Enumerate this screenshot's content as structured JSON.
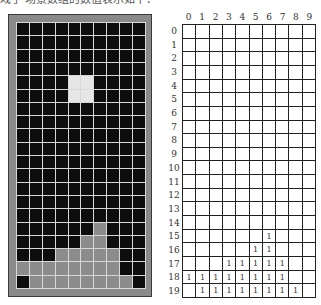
{
  "caption": "戏子 场景数组的数值表示如下：",
  "board": {
    "rows": 20,
    "cols": 10,
    "active_piece": {
      "shape": "O",
      "cells": [
        [
          4,
          4
        ],
        [
          4,
          5
        ],
        [
          5,
          4
        ],
        [
          5,
          5
        ]
      ]
    },
    "filled_cells": [
      [
        15,
        6
      ],
      [
        16,
        5
      ],
      [
        16,
        6
      ],
      [
        17,
        3
      ],
      [
        17,
        4
      ],
      [
        17,
        5
      ],
      [
        17,
        6
      ],
      [
        17,
        7
      ],
      [
        18,
        0
      ],
      [
        18,
        1
      ],
      [
        18,
        2
      ],
      [
        18,
        3
      ],
      [
        18,
        4
      ],
      [
        18,
        5
      ],
      [
        18,
        6
      ],
      [
        18,
        7
      ],
      [
        19,
        1
      ],
      [
        19,
        2
      ],
      [
        19,
        3
      ],
      [
        19,
        4
      ],
      [
        19,
        5
      ],
      [
        19,
        6
      ],
      [
        19,
        7
      ],
      [
        19,
        8
      ]
    ],
    "colors": {
      "empty": "#0d0d0d",
      "filled": "#8c8c8c",
      "active": "#e6e6e6",
      "frame": "#8a8a8a",
      "grid_line": "#d8d8d8"
    }
  },
  "table": {
    "col_headers": [
      "0",
      "1",
      "2",
      "3",
      "4",
      "5",
      "6",
      "7",
      "8",
      "9"
    ],
    "row_headers": [
      "0",
      "1",
      "2",
      "3",
      "4",
      "5",
      "6",
      "7",
      "8",
      "9",
      "10",
      "11",
      "12",
      "13",
      "14",
      "15",
      "16",
      "17",
      "18",
      "19"
    ],
    "values": [
      [
        "",
        "",
        "",
        "",
        "",
        "",
        "",
        "",
        "",
        ""
      ],
      [
        "",
        "",
        "",
        "",
        "",
        "",
        "",
        "",
        "",
        ""
      ],
      [
        "",
        "",
        "",
        "",
        "",
        "",
        "",
        "",
        "",
        ""
      ],
      [
        "",
        "",
        "",
        "",
        "",
        "",
        "",
        "",
        "",
        ""
      ],
      [
        "",
        "",
        "",
        "",
        "",
        "",
        "",
        "",
        "",
        ""
      ],
      [
        "",
        "",
        "",
        "",
        "",
        "",
        "",
        "",
        "",
        ""
      ],
      [
        "",
        "",
        "",
        "",
        "",
        "",
        "",
        "",
        "",
        ""
      ],
      [
        "",
        "",
        "",
        "",
        "",
        "",
        "",
        "",
        "",
        ""
      ],
      [
        "",
        "",
        "",
        "",
        "",
        "",
        "",
        "",
        "",
        ""
      ],
      [
        "",
        "",
        "",
        "",
        "",
        "",
        "",
        "",
        "",
        ""
      ],
      [
        "",
        "",
        "",
        "",
        "",
        "",
        "",
        "",
        "",
        ""
      ],
      [
        "",
        "",
        "",
        "",
        "",
        "",
        "",
        "",
        "",
        ""
      ],
      [
        "",
        "",
        "",
        "",
        "",
        "",
        "",
        "",
        "",
        ""
      ],
      [
        "",
        "",
        "",
        "",
        "",
        "",
        "",
        "",
        "",
        ""
      ],
      [
        "",
        "",
        "",
        "",
        "",
        "",
        "",
        "",
        "",
        ""
      ],
      [
        "",
        "",
        "",
        "",
        "",
        "",
        "1",
        "",
        "",
        ""
      ],
      [
        "",
        "",
        "",
        "",
        "",
        "1",
        "1",
        "",
        "",
        ""
      ],
      [
        "",
        "",
        "",
        "1",
        "1",
        "1",
        "1",
        "1",
        "",
        ""
      ],
      [
        "1",
        "1",
        "1",
        "1",
        "1",
        "1",
        "1",
        "1",
        "",
        ""
      ],
      [
        "",
        "1",
        "1",
        "1",
        "1",
        "1",
        "1",
        "1",
        "1",
        ""
      ]
    ]
  }
}
